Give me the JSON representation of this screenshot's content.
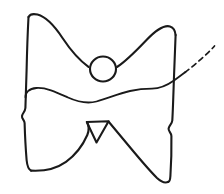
{
  "figure": {
    "title": "Hand-drawn butterfly outline sketch",
    "background_color": "#ffffff",
    "ink_color": "#1a1a1a",
    "width": 224,
    "height": 194
  },
  "strokes": {
    "left_outer_edge": {
      "name": "left-outer-edge",
      "style": "solid",
      "d": "M 28.5 17 C 27.6 34 27.0 52 26.6 70 C 26.2 86 25.8 98 25.4 108 C 25.0 112 22.5 113 22.0 116 C 21.6 119 24.4 120 24.6 123 C 24.9 133 25.6 148 26.6 160 C 27.2 166 28.6 169.5 31.0 170.6"
    },
    "left_wing_top": {
      "name": "left-wing-top-arc",
      "style": "solid",
      "d": "M 28.5 17 C 30.0 14.2 33.5 13.6 37.5 14.6 C 46 16.8 54.5 26.0 62.5 38.0 C 70.5 50.0 79.5 60.5 88.5 66.8"
    },
    "right_wing_top": {
      "name": "right-wing-top-arc",
      "style": "solid",
      "d": "M 117.0 67.0 C 126.5 61.0 136.5 50.5 146.5 40.0 C 156.5 29.5 165.0 25.0 170.0 26.4 C 173.4 27.4 175.2 30.4 175.6 35.0"
    },
    "right_outer_edge": {
      "name": "right-outer-edge",
      "style": "solid",
      "d": "M 175.6 35.0 C 175.0 50 174.4 66 173.8 82 C 173.3 98 172.8 112 172.3 120.5 C 172.0 124 169.0 125.5 168.6 128.5 C 168.2 131.5 171.3 132.6 171.4 136.0 C 171.6 148 171.2 164 170.4 176.0 C 170.2 179.5 169.6 181.4 168.4 181.8"
    },
    "left_wing_bottom": {
      "name": "left-wing-bottom-arc",
      "style": "solid",
      "d": "M 31.0 170.6 C 45 171.4 56.5 168.5 66.0 161.8 C 76.5 154.3 82.5 146.0 87.3 135.0 C 88.4 132.4 89.6 127.0 87.0 122.0"
    },
    "right_wing_bottom": {
      "name": "right-wing-bottom-arc",
      "style": "solid",
      "d": "M 108.5 121.5 C 113.5 127.5 121.0 136.5 131.0 148.5 C 141.0 160.5 150.5 171.5 157.0 178.0 C 161.5 182.2 165.5 183.2 168.4 181.8"
    },
    "head_circle": {
      "name": "head-circle",
      "style": "solid",
      "shape": "circle",
      "cx": 103,
      "cy": 69,
      "rx": 13,
      "ry": 12.5
    },
    "body_triangle": {
      "name": "body-triangle",
      "style": "solid",
      "d": "M 86.8 122.0 L 108.6 121.2 L 96.5 142.5 Z"
    },
    "wavy_line": {
      "name": "wavy-horizontal-line",
      "style": "solid",
      "d": "M 25.5 97.5 C 25.0 92.5 29.0 88.5 36.5 88.0 C 46.5 87.4 57.0 92.5 68.0 97.5 C 79.0 102.5 87.5 103.8 96.5 101.5 C 107.0 98.8 118.0 93.6 130.0 91.0 C 139.0 89.0 145.0 88.6 152.0 88.6 C 160.0 88.6 166.5 85.8 174.0 80.5 C 179.0 77.0 182.5 74.3 185.5 72.0"
    },
    "dashed_tail": {
      "name": "dashed-tail-line",
      "style": "dashed",
      "dash_pattern": "5 4",
      "d": "M 185.0 72.4 C 191.5 67.5 198.5 61.5 205.0 55.5 C 209.5 51.3 212.5 48.3 214.5 46.0"
    }
  },
  "labels": {
    "none_visible": ""
  }
}
